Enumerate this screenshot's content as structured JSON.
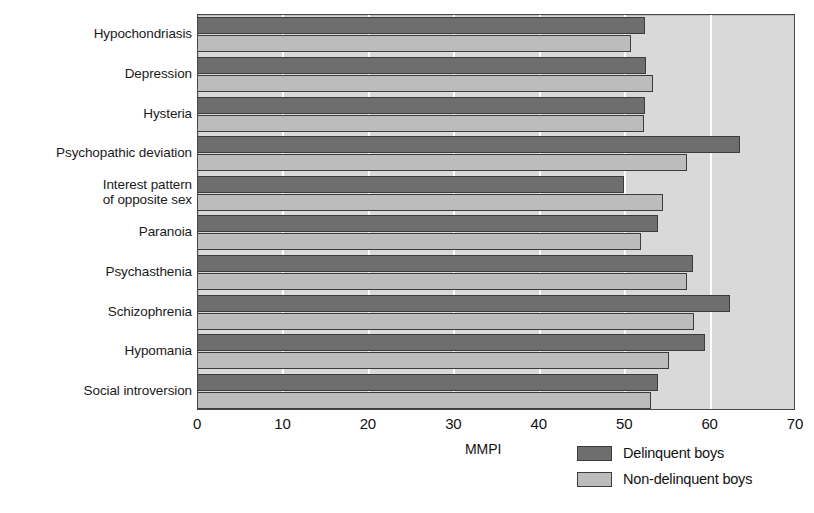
{
  "chart_data": {
    "type": "bar",
    "orientation": "horizontal",
    "title": "",
    "xlabel": "MMPI",
    "ylabel": "",
    "xlim": [
      0,
      70
    ],
    "xticks": [
      0,
      10,
      20,
      30,
      40,
      50,
      60,
      70
    ],
    "xtick_labels": [
      "0",
      "10",
      "20",
      "30",
      "40",
      "50",
      "60",
      "70"
    ],
    "grid": "vertical",
    "legend_position": "bottom-right",
    "categories": [
      "Hypochondriasis",
      "Depression",
      "Hysteria",
      "Psychopathic deviation",
      "Interest pattern\nof opposite sex",
      "Paranoia",
      "Psychasthenia",
      "Schizophrenia",
      "Hypomania",
      "Social introversion"
    ],
    "series": [
      {
        "name": "Delinquent boys",
        "color": "#6e6e6e",
        "values": [
          52.3,
          52.4,
          52.3,
          63.5,
          49.9,
          53.9,
          58.0,
          62.3,
          59.3,
          53.9
        ]
      },
      {
        "name": "Non-delinquent boys",
        "color": "#bcbcbc",
        "values": [
          50.7,
          53.3,
          52.2,
          57.2,
          54.4,
          51.8,
          57.2,
          58.1,
          55.1,
          53.0
        ]
      }
    ]
  },
  "legend": {
    "items": [
      {
        "label": "Delinquent boys",
        "swatch": "dark"
      },
      {
        "label": "Non-delinquent boys",
        "swatch": "light"
      }
    ]
  },
  "colors": {
    "plot_background": "#d9d9d9",
    "page_background": "#ffffff",
    "gridline": "#fdfdfd",
    "frame": "#4a4a4a",
    "bar_dark": "#6e6e6e",
    "bar_light": "#bcbcbc",
    "text": "#111111"
  }
}
